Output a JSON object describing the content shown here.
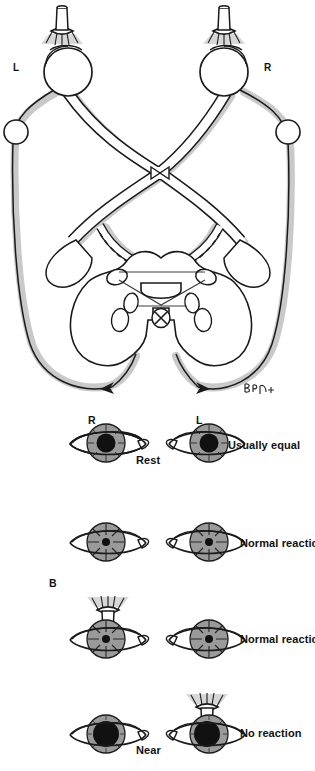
{
  "figure": {
    "type": "medical-illustration",
    "background_color": "#ffffff",
    "ink_color": "#1a1a1a",
    "shadow_color": "#c9c9c9",
    "iris_color": "#9a9a9a",
    "pupil_color": "#111111"
  },
  "pathway": {
    "label_left_eye": "L",
    "label_right_eye": "R",
    "signature": "BPH"
  },
  "rows": {
    "header_left": "R",
    "header_right": "L",
    "panel_label": "B",
    "rest": {
      "center_label": "Rest",
      "right_text": "Usually equal",
      "pupil_state": "mid-dilated"
    },
    "light_left": {
      "right_text": "Normal reaction",
      "pupil_state": "constricted",
      "light_on": "left"
    },
    "light_right": {
      "right_text": "Normal reaction",
      "pupil_state": "constricted",
      "light_on": "right"
    },
    "near": {
      "center_label": "Near",
      "right_text": "No reaction",
      "pupil_state": "dilated"
    }
  }
}
